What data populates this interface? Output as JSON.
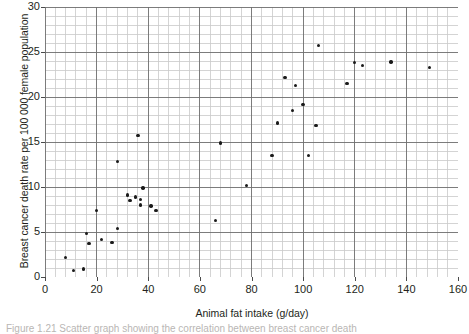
{
  "figure": {
    "caption": "Figure 1.21 Scatter graph showing the correlation between breast cancer death"
  },
  "chart_data": {
    "type": "scatter",
    "title": "",
    "xlabel": "Animal fat intake (g/day)",
    "ylabel": "Breast cancer death rate per 100 000 female population",
    "xlim": [
      0,
      160
    ],
    "ylim": [
      0,
      30
    ],
    "xticks": [
      0,
      20,
      40,
      60,
      80,
      100,
      120,
      140,
      160
    ],
    "yticks": [
      0,
      5,
      10,
      15,
      20,
      25,
      30
    ],
    "xtick_labels": [
      "0",
      "20",
      "40",
      "60",
      "80",
      "100",
      "120",
      "140",
      "160"
    ],
    "ytick_labels": [
      "0",
      "5",
      "10",
      "15",
      "20",
      "25",
      "30"
    ],
    "x_major_step": 20,
    "x_minor_step": 4,
    "y_major_step": 5,
    "y_minor_step": 1,
    "grid": true,
    "grid_major_color": "#6e6e6e",
    "grid_minor_color": "#c9c9c9",
    "legend": null,
    "marker": "filled-circle",
    "marker_color": "#1a1a1a",
    "points": [
      {
        "x": 8,
        "y": 2.2
      },
      {
        "x": 11,
        "y": 0.7
      },
      {
        "x": 15,
        "y": 0.9
      },
      {
        "x": 16,
        "y": 4.8
      },
      {
        "x": 17,
        "y": 3.7
      },
      {
        "x": 20,
        "y": 7.4
      },
      {
        "x": 22,
        "y": 4.2
      },
      {
        "x": 26,
        "y": 3.8
      },
      {
        "x": 28,
        "y": 5.4
      },
      {
        "x": 28,
        "y": 12.8
      },
      {
        "x": 32,
        "y": 9.1
      },
      {
        "x": 33,
        "y": 8.5
      },
      {
        "x": 35,
        "y": 8.9
      },
      {
        "x": 36,
        "y": 15.7
      },
      {
        "x": 37,
        "y": 8.6
      },
      {
        "x": 37,
        "y": 8.0
      },
      {
        "x": 38,
        "y": 9.9
      },
      {
        "x": 41,
        "y": 7.9
      },
      {
        "x": 43,
        "y": 7.4
      },
      {
        "x": 66,
        "y": 6.3
      },
      {
        "x": 68,
        "y": 14.9
      },
      {
        "x": 78,
        "y": 10.2
      },
      {
        "x": 88,
        "y": 13.5
      },
      {
        "x": 90,
        "y": 17.1
      },
      {
        "x": 93,
        "y": 22.2
      },
      {
        "x": 96,
        "y": 18.5
      },
      {
        "x": 97,
        "y": 21.3
      },
      {
        "x": 100,
        "y": 19.2
      },
      {
        "x": 102,
        "y": 13.5
      },
      {
        "x": 105,
        "y": 16.8
      },
      {
        "x": 106,
        "y": 25.7
      },
      {
        "x": 117,
        "y": 21.5
      },
      {
        "x": 120,
        "y": 23.8
      },
      {
        "x": 123,
        "y": 23.5
      },
      {
        "x": 134,
        "y": 23.9
      },
      {
        "x": 149,
        "y": 23.3
      }
    ]
  }
}
